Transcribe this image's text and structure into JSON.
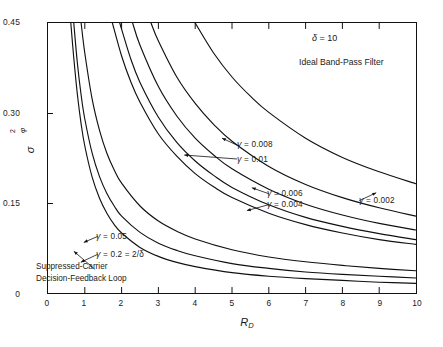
{
  "figure": {
    "background": "#ffffff",
    "line_color": "#111111"
  },
  "axes": {
    "x": {
      "label": "R",
      "label_sub": "D",
      "min": 0,
      "max": 10,
      "ticks": [
        0,
        1,
        2,
        3,
        4,
        5,
        6,
        7,
        8,
        9,
        10
      ],
      "tick_labels": [
        "0",
        "1",
        "2",
        "3",
        "4",
        "5",
        "6",
        "7",
        "8",
        "9",
        "10"
      ]
    },
    "y": {
      "label_symbol": "σ",
      "label_sup": "2",
      "label_sub": "φ",
      "min": 0,
      "max": 0.45,
      "ticks": [
        0,
        0.15,
        0.3,
        0.45
      ],
      "tick_labels": [
        "0",
        "0.15",
        "0.30",
        "0.45"
      ]
    }
  },
  "annotations": {
    "delta": "δ = 10",
    "delta_symbol": "δ",
    "delta_value": " = 10",
    "filter": "Ideal Band-Pass Filter",
    "reference_line1": "Suppressed-Carrier",
    "reference_line2": "Decision-Feedback Loop",
    "gamma_0008": "= 0.008",
    "gamma_001": "= 0.01",
    "gamma_0006": "= 0.006",
    "gamma_0004": "= 0.004",
    "gamma_0002": "= 0.002",
    "gamma_005": "= 0.05",
    "gamma_02": "= 0.2 = 2/δ",
    "gamma_symbol": "γ"
  },
  "chart_data": {
    "type": "line",
    "title": "",
    "subtitle": "",
    "xlabel": "R_D",
    "ylabel": "sigma^2_phi",
    "xlim": [
      0,
      10
    ],
    "ylim": [
      0,
      0.45
    ],
    "grid": false,
    "legend": "inline-annotations",
    "parameters": {
      "delta": 10,
      "filter": "Ideal Band-Pass Filter"
    },
    "series": [
      {
        "name": "Suppressed-Carrier Decision-Feedback Loop",
        "gamma": null,
        "x": [
          0.62,
          0.7,
          0.8,
          0.9,
          1.0,
          1.2,
          1.4,
          1.6,
          1.8,
          2.0,
          2.5,
          3.0,
          3.5,
          4.0,
          5.0,
          6.0,
          7.0,
          8.0,
          9.0,
          10.0
        ],
        "y": [
          0.45,
          0.392,
          0.33,
          0.282,
          0.245,
          0.193,
          0.158,
          0.133,
          0.114,
          0.1,
          0.076,
          0.061,
          0.051,
          0.044,
          0.034,
          0.028,
          0.024,
          0.021,
          0.018,
          0.016
        ]
      },
      {
        "name": "gamma = 0.2 = 2/delta",
        "gamma": 0.2,
        "x": [
          0.7,
          0.8,
          0.9,
          1.0,
          1.2,
          1.4,
          1.6,
          1.8,
          2.0,
          2.5,
          3.0,
          3.5,
          4.0,
          5.0,
          6.0,
          7.0,
          8.0,
          9.0,
          10.0
        ],
        "y": [
          0.45,
          0.382,
          0.33,
          0.29,
          0.233,
          0.194,
          0.166,
          0.145,
          0.128,
          0.101,
          0.083,
          0.071,
          0.062,
          0.049,
          0.041,
          0.035,
          0.031,
          0.028,
          0.025
        ]
      },
      {
        "name": "gamma = 0.05",
        "gamma": 0.05,
        "x": [
          0.9,
          1.0,
          1.2,
          1.4,
          1.6,
          1.8,
          2.0,
          2.5,
          3.0,
          3.5,
          4.0,
          5.0,
          6.0,
          7.0,
          8.0,
          9.0,
          10.0
        ],
        "y": [
          0.45,
          0.4,
          0.323,
          0.271,
          0.233,
          0.205,
          0.183,
          0.145,
          0.12,
          0.103,
          0.09,
          0.072,
          0.06,
          0.052,
          0.046,
          0.041,
          0.037
        ]
      },
      {
        "name": "gamma = 0.01",
        "gamma": 0.01,
        "x": [
          1.75,
          2.0,
          2.25,
          2.5,
          3.0,
          3.5,
          4.0,
          4.5,
          5.0,
          6.0,
          7.0,
          8.0,
          9.0,
          10.0
        ],
        "y": [
          0.45,
          0.395,
          0.352,
          0.318,
          0.265,
          0.228,
          0.199,
          0.177,
          0.159,
          0.133,
          0.114,
          0.1,
          0.089,
          0.081
        ]
      },
      {
        "name": "gamma = 0.008",
        "gamma": 0.008,
        "x": [
          1.95,
          2.25,
          2.5,
          3.0,
          3.5,
          4.0,
          4.5,
          5.0,
          6.0,
          7.0,
          8.0,
          9.0,
          10.0
        ],
        "y": [
          0.45,
          0.39,
          0.351,
          0.293,
          0.251,
          0.22,
          0.196,
          0.176,
          0.147,
          0.126,
          0.111,
          0.099,
          0.089
        ]
      },
      {
        "name": "gamma = 0.006",
        "gamma": 0.006,
        "x": [
          2.3,
          2.5,
          3.0,
          3.5,
          4.0,
          4.5,
          5.0,
          6.0,
          7.0,
          8.0,
          9.0,
          10.0
        ],
        "y": [
          0.45,
          0.413,
          0.344,
          0.295,
          0.258,
          0.23,
          0.207,
          0.173,
          0.148,
          0.13,
          0.116,
          0.105
        ]
      },
      {
        "name": "gamma = 0.004",
        "gamma": 0.004,
        "x": [
          2.8,
          3.0,
          3.5,
          4.0,
          4.5,
          5.0,
          6.0,
          7.0,
          8.0,
          9.0,
          10.0
        ],
        "y": [
          0.45,
          0.42,
          0.36,
          0.316,
          0.281,
          0.253,
          0.211,
          0.181,
          0.159,
          0.142,
          0.128
        ]
      },
      {
        "name": "gamma = 0.002",
        "gamma": 0.002,
        "x": [
          4.0,
          4.5,
          5.0,
          5.5,
          6.0,
          7.0,
          8.0,
          9.0,
          10.0
        ],
        "y": [
          0.45,
          0.4,
          0.36,
          0.328,
          0.301,
          0.258,
          0.226,
          0.202,
          0.182
        ]
      }
    ]
  }
}
